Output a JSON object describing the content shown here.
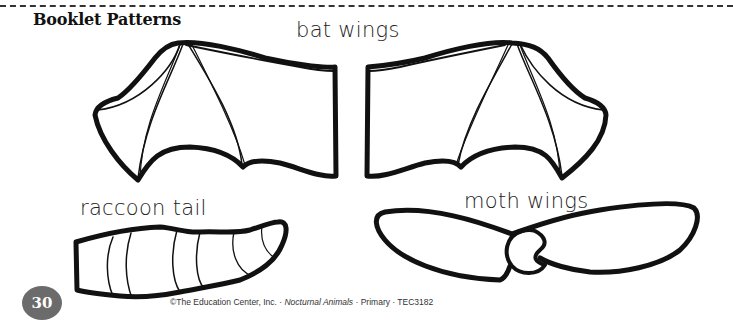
{
  "page": {
    "title": "Booklet Patterns",
    "page_number": "30"
  },
  "patterns": {
    "bat_wings_label": "bat wings",
    "raccoon_tail_label": "raccoon tail",
    "moth_wings_label": "moth wings"
  },
  "footer": {
    "copyright": "©The Education Center, Inc. · ",
    "book_title": "Nocturnal Animals",
    "suffix": " · Primary · TEC3182"
  },
  "colors": {
    "ink": "#111111",
    "badge": "#6b6b6b",
    "background": "#ffffff"
  }
}
